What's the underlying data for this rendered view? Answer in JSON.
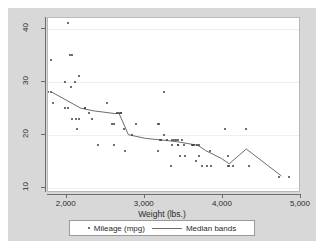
{
  "chart_data": {
    "type": "scatter",
    "title": "",
    "xlabel": "Weight (lbs.)",
    "ylabel": "",
    "xlim": [
      1760,
      5000
    ],
    "ylim": [
      9,
      42
    ],
    "xticks": [
      2000,
      3000,
      4000,
      5000
    ],
    "xticklabels": [
      "2,000",
      "3,000",
      "4,000",
      "5,000"
    ],
    "yticks": [
      10,
      20,
      30,
      40
    ],
    "yticklabels": [
      "10",
      "20",
      "30",
      "40"
    ],
    "grid": "horizontal",
    "legend_position": "bottom",
    "legend": [
      {
        "label": "Mileage (mpg)",
        "marker": "dot",
        "color": "#404040"
      },
      {
        "label": "Median bands",
        "marker": "line",
        "color": "#6d6d6d"
      }
    ],
    "series": [
      {
        "name": "Mileage (mpg)",
        "type": "scatter",
        "points": [
          [
            1760,
            28
          ],
          [
            1800,
            28
          ],
          [
            1800,
            34
          ],
          [
            1830,
            26
          ],
          [
            1980,
            30
          ],
          [
            1980,
            25
          ],
          [
            2020,
            25
          ],
          [
            2020,
            41
          ],
          [
            2040,
            35
          ],
          [
            2070,
            35
          ],
          [
            2050,
            29
          ],
          [
            2110,
            30
          ],
          [
            2160,
            31
          ],
          [
            2160,
            23
          ],
          [
            2070,
            23
          ],
          [
            2120,
            23
          ],
          [
            2130,
            21
          ],
          [
            2230,
            25
          ],
          [
            2240,
            25
          ],
          [
            2280,
            24
          ],
          [
            2320,
            23
          ],
          [
            2400,
            18
          ],
          [
            2520,
            26
          ],
          [
            2580,
            22
          ],
          [
            2600,
            22
          ],
          [
            2600,
            18
          ],
          [
            2650,
            24
          ],
          [
            2670,
            24
          ],
          [
            2690,
            24
          ],
          [
            2700,
            24
          ],
          [
            2730,
            21
          ],
          [
            2750,
            17
          ],
          [
            2830,
            20
          ],
          [
            2890,
            22
          ],
          [
            3170,
            22
          ],
          [
            3180,
            22
          ],
          [
            3200,
            19
          ],
          [
            3210,
            19
          ],
          [
            3170,
            17
          ],
          [
            3250,
            28
          ],
          [
            3250,
            20
          ],
          [
            3280,
            19
          ],
          [
            3330,
            14
          ],
          [
            3350,
            18
          ],
          [
            3350,
            19
          ],
          [
            3370,
            19
          ],
          [
            3400,
            19
          ],
          [
            3420,
            19
          ],
          [
            3430,
            18
          ],
          [
            3430,
            18
          ],
          [
            3450,
            16
          ],
          [
            3470,
            19
          ],
          [
            3500,
            18
          ],
          [
            3520,
            16
          ],
          [
            3600,
            18
          ],
          [
            3620,
            18
          ],
          [
            3630,
            18
          ],
          [
            3650,
            15
          ],
          [
            3670,
            18
          ],
          [
            3690,
            18
          ],
          [
            3700,
            16
          ],
          [
            3730,
            14
          ],
          [
            3800,
            14
          ],
          [
            3830,
            17
          ],
          [
            3850,
            14
          ],
          [
            4030,
            21
          ],
          [
            4060,
            16
          ],
          [
            4060,
            14
          ],
          [
            4080,
            14
          ],
          [
            4130,
            14
          ],
          [
            4290,
            21
          ],
          [
            4330,
            14
          ],
          [
            4720,
            12
          ],
          [
            4840,
            12
          ]
        ]
      },
      {
        "name": "Median bands",
        "type": "line",
        "color": "#6d6d6d",
        "points": [
          [
            1810,
            28
          ],
          [
            2180,
            25
          ],
          [
            2340,
            24.5
          ],
          [
            2610,
            24
          ],
          [
            2670,
            24
          ],
          [
            2790,
            20
          ],
          [
            3010,
            19.3
          ],
          [
            3220,
            19
          ],
          [
            3400,
            18.7
          ],
          [
            3560,
            18.3
          ],
          [
            3680,
            18
          ],
          [
            3780,
            17
          ],
          [
            3980,
            15.5
          ],
          [
            4080,
            14.5
          ],
          [
            4300,
            17.3
          ],
          [
            4750,
            12.2
          ]
        ]
      }
    ]
  }
}
